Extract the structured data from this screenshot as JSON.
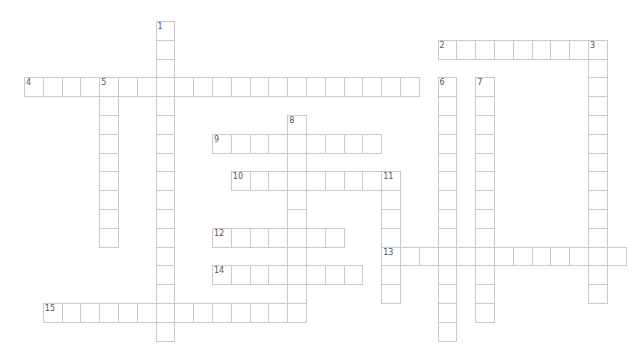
{
  "puzzle": {
    "type": "crossword",
    "cell_size": 18.8,
    "origin": {
      "x": 24,
      "y": 21
    },
    "colors": {
      "border": "#c9c9c9",
      "number": "#555555",
      "background": "#ffffff"
    },
    "words": [
      {
        "number": "1",
        "direction": "down",
        "row": 0,
        "col": 7,
        "length": 17
      },
      {
        "number": "2",
        "direction": "across",
        "row": 1,
        "col": 22,
        "length": 9
      },
      {
        "number": "3",
        "direction": "down",
        "row": 1,
        "col": 30,
        "length": 14
      },
      {
        "number": "4",
        "direction": "across",
        "row": 3,
        "col": 0,
        "length": 21
      },
      {
        "number": "5",
        "direction": "down",
        "row": 3,
        "col": 4,
        "length": 9
      },
      {
        "number": "6",
        "direction": "down",
        "row": 3,
        "col": 22,
        "length": 14
      },
      {
        "number": "7",
        "direction": "down",
        "row": 3,
        "col": 24,
        "length": 13
      },
      {
        "number": "8",
        "direction": "down",
        "row": 5,
        "col": 14,
        "length": 11
      },
      {
        "number": "9",
        "direction": "across",
        "row": 6,
        "col": 10,
        "length": 9
      },
      {
        "number": "10",
        "direction": "across",
        "row": 8,
        "col": 11,
        "length": 9
      },
      {
        "number": "11",
        "direction": "down",
        "row": 8,
        "col": 19,
        "length": 7
      },
      {
        "number": "12",
        "direction": "across",
        "row": 11,
        "col": 10,
        "length": 7
      },
      {
        "number": "13",
        "direction": "across",
        "row": 12,
        "col": 19,
        "length": 13
      },
      {
        "number": "14",
        "direction": "across",
        "row": 13,
        "col": 10,
        "length": 8
      },
      {
        "number": "15",
        "direction": "across",
        "row": 15,
        "col": 1,
        "length": 14
      }
    ]
  }
}
